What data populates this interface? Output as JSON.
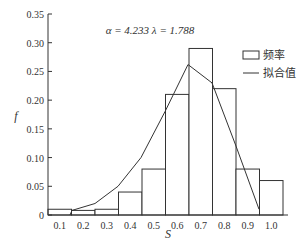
{
  "chart_data": {
    "type": "bar",
    "title": "",
    "annotation": "α = 4.233  λ = 1.788",
    "xlabel": "S",
    "ylabel": "f",
    "categories": [
      "0.1",
      "0.2",
      "0.3",
      "0.4",
      "0.5",
      "0.6",
      "0.7",
      "0.8",
      "0.9",
      "1.0"
    ],
    "yticks": [
      "0",
      "0.05",
      "0.10",
      "0.15",
      "0.20",
      "0.25",
      "0.30",
      "0.35"
    ],
    "ylim": [
      0,
      0.35
    ],
    "grid": false,
    "legend_position": "upper right",
    "series": [
      {
        "name": "频率",
        "type": "bar",
        "values": [
          0.01,
          0.008,
          0.01,
          0.04,
          0.08,
          0.21,
          0.29,
          0.22,
          0.08,
          0.06
        ]
      },
      {
        "name": "拟合值",
        "type": "line",
        "values": [
          0.0,
          0.008,
          0.02,
          0.05,
          0.1,
          0.18,
          0.262,
          0.23,
          0.12,
          0.01
        ]
      }
    ]
  },
  "legend": {
    "bar_label": "频率",
    "line_label": "拟合值"
  },
  "annotation": "α = 4.233  λ = 1.788",
  "axis": {
    "x_label": "S",
    "y_label": "f"
  }
}
